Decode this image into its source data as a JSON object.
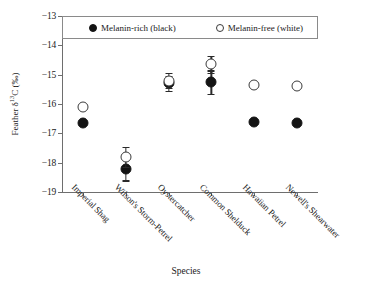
{
  "chart_data": {
    "type": "scatter",
    "title": "",
    "xlabel": "Species",
    "ylabel": "Feather δ¹³C (‰)",
    "ylim": [
      -19,
      -13
    ],
    "yticks": [
      "−13",
      "−14",
      "−15",
      "−16",
      "−17",
      "−18",
      "−19"
    ],
    "ytick_values": [
      -13,
      -14,
      -15,
      -16,
      -17,
      -18,
      -19
    ],
    "grid": false,
    "legend_position": "top-inside",
    "categories": [
      "Imperial Shag",
      "Wilson's Storm-Petrel",
      "Oystercatcher",
      "Common Shelduck",
      "Hawaiian Petrel",
      "Newell's Shearwater"
    ],
    "series": [
      {
        "name": "Melanin-rich (black)",
        "marker": "filled-circle",
        "color": "#141414",
        "values": [
          -16.65,
          -18.2,
          -15.3,
          -15.25,
          -16.6,
          -16.65
        ],
        "errors": [
          0,
          0.4,
          0.25,
          0.4,
          0,
          0
        ]
      },
      {
        "name": "Melanin-free (white)",
        "marker": "open-circle",
        "color": "#ffffff",
        "values": [
          -16.1,
          -17.8,
          -15.2,
          -14.65,
          -15.35,
          -15.4
        ],
        "errors": [
          0,
          0.35,
          0.25,
          0.3,
          0,
          0
        ]
      }
    ]
  },
  "legend": {
    "entries": [
      {
        "label": "Melanin-rich (black)",
        "marker": "filled-circle"
      },
      {
        "label": "Melanin-free (white)",
        "marker": "open-circle"
      }
    ]
  },
  "axes": {
    "y_title": "Feather δ",
    "y_title_sup": "13",
    "y_title_tail": "C (‰)",
    "x_title": "Species"
  }
}
